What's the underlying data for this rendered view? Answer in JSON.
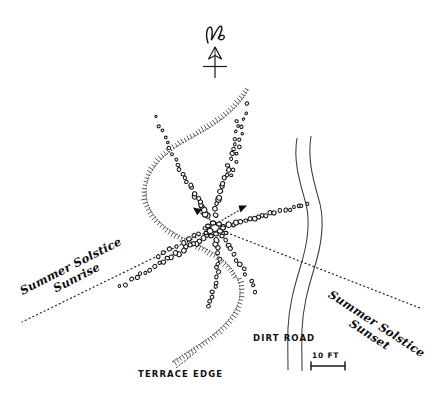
{
  "map": {
    "title": "Archaeological Site Plan",
    "background_color": "#ffffff",
    "ink_color": "#111111",
    "width": 442,
    "height": 401
  },
  "north_arrow": {
    "letter": "N",
    "name": "north-arrow"
  },
  "labels": {
    "sunrise_line1": "Summer Solstice",
    "sunrise_line2": "Sunrise",
    "sunset_line1": "Summer Solstice",
    "sunset_line2": "Sunset",
    "terrace_edge": "TERRACE EDGE",
    "dirt_road": "DIRT ROAD"
  },
  "scale_bar": {
    "label": "10 FT",
    "length_px": 34
  },
  "features": [
    {
      "name": "stone-alignment-northwest",
      "type": "stone-row"
    },
    {
      "name": "stone-alignment-north",
      "type": "stone-row"
    },
    {
      "name": "stone-alignment-northeast",
      "type": "stone-row"
    },
    {
      "name": "stone-alignment-east",
      "type": "stone-row"
    },
    {
      "name": "stone-alignment-south",
      "type": "stone-row"
    },
    {
      "name": "stone-alignment-southwest",
      "type": "stone-row"
    },
    {
      "name": "central-cairn",
      "type": "stone-cluster"
    },
    {
      "name": "terrace-edge-curve",
      "type": "hachured-scarp"
    },
    {
      "name": "dirt-road",
      "type": "double-line-track"
    },
    {
      "name": "sunrise-sightline",
      "type": "dotted-alignment"
    },
    {
      "name": "sunset-sightline",
      "type": "dotted-alignment"
    },
    {
      "name": "sightline-arrow-northwest",
      "type": "arrow"
    },
    {
      "name": "sightline-arrow-northeast",
      "type": "arrow"
    }
  ]
}
